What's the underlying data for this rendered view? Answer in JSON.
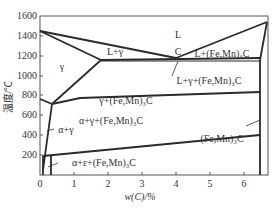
{
  "diagram": {
    "type": "phase-diagram",
    "xlabel": "w(C)/%",
    "ylabel": "温度/℃",
    "x_ticks": [
      "0",
      "1",
      "2",
      "3",
      "4",
      "5",
      "6"
    ],
    "y_ticks": [
      "200",
      "400",
      "600",
      "800",
      "1000",
      "1200",
      "1400",
      "1600"
    ],
    "point_labels": {
      "C": "C"
    },
    "regions": {
      "L": "L",
      "L_gamma": "L+γ",
      "gamma": "γ",
      "L_cementite": "L+(Fe,Mn)₃C",
      "L_gamma_cementite": "L+γ+(Fe,Mn)₃C",
      "gamma_cementite": "γ+(Fe,Mn)₃C",
      "alpha_gamma_cementite": "α+γ+(Fe,Mn)₃C",
      "alpha_gamma": "α+γ",
      "alpha_epsilon_cementite": "α+ε+(Fe,Mn)₃C",
      "cementite": "(Fe,Mn)₃C"
    }
  }
}
